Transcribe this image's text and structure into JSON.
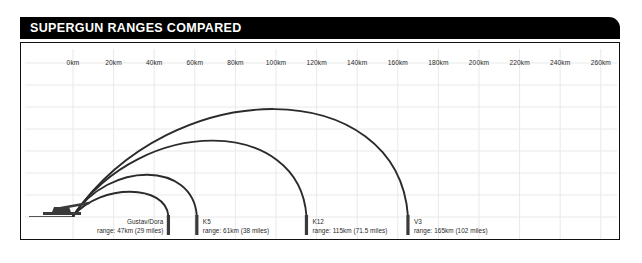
{
  "header": {
    "title": "SUPERGUN RANGES COMPARED",
    "bar_color": "#000000",
    "text_color": "#ffffff"
  },
  "chart_data": {
    "type": "line",
    "title": "SUPERGUN RANGES COMPARED",
    "xlabel": "",
    "ylabel": "",
    "xlim": [
      0,
      265
    ],
    "grid": true,
    "legend": "none",
    "x_unit": "km",
    "tick_labels": [
      "0km",
      "20km",
      "40km",
      "60km",
      "80km",
      "100km",
      "120km",
      "140km",
      "160km",
      "180km",
      "200km",
      "220km",
      "240km",
      "260km"
    ],
    "tick_values": [
      0,
      20,
      40,
      60,
      80,
      100,
      120,
      140,
      160,
      180,
      200,
      220,
      240,
      260
    ],
    "origin_icon": "railway-gun-icon",
    "series": [
      {
        "name": "Gustav/Dora",
        "range_km": 47,
        "range_miles": 29,
        "range_text": "range: 47km (29 miles)",
        "apex_km": 23.5,
        "apex_height_frac": 0.2,
        "label_align": "right"
      },
      {
        "name": "K5",
        "range_km": 61,
        "range_miles": 38,
        "range_text": "range: 61km (38 miles)",
        "apex_km": 30.5,
        "apex_height_frac": 0.34,
        "label_align": "left"
      },
      {
        "name": "K12",
        "range_km": 115,
        "range_miles": 71.5,
        "range_text": "range: 115km (71.5 miles)",
        "apex_km": 57.5,
        "apex_height_frac": 0.62,
        "label_align": "left"
      },
      {
        "name": "V3",
        "range_km": 165,
        "range_miles": 102,
        "range_text": "range: 165km (102 miles)",
        "apex_km": 82.5,
        "apex_height_frac": 0.88,
        "label_align": "left"
      }
    ],
    "arc_color": "#2b2b2b",
    "grid_color": "#e9e9e9",
    "marker_color": "#3a3a3a"
  }
}
